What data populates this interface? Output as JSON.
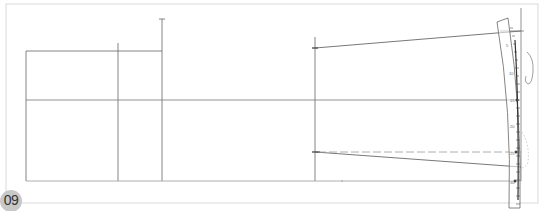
{
  "figure": {
    "step_number": "09",
    "colors": {
      "frame": "#d9d9d9",
      "line": "#555555",
      "guide_line": "#888888",
      "ruler": "#666666",
      "badge_bg": "#c8c8c8",
      "badge_text": "#333333"
    },
    "frame": {
      "x": 6,
      "y": 4,
      "width": 532,
      "height": 199
    },
    "lines": {
      "left_rect": {
        "x1": 26,
        "y1": 51,
        "x2": 162,
        "y2": 181
      },
      "vertical_a": {
        "x": 118,
        "y_top": 43,
        "y_bottom": 181
      },
      "vertical_b": {
        "x": 162,
        "y_top": 19,
        "y_bottom": 181
      },
      "vertical_c": {
        "x": 315,
        "y_top": 37,
        "y_bottom": 181
      },
      "vertical_right": {
        "x": 521,
        "y_top": 8,
        "y_bottom": 181
      },
      "center_horizontal": {
        "x1": 26,
        "x2": 519,
        "y": 100
      },
      "bottom_horizontal": {
        "x1": 26,
        "x2": 521,
        "y": 181
      },
      "upper_slope": {
        "x1": 315,
        "y1": 48,
        "x2": 521,
        "y2": 31
      },
      "lower_slope": {
        "x1": 315,
        "y1": 152,
        "x2": 521,
        "y2": 167
      },
      "lower_dashed": {
        "x1": 315,
        "y1": 152,
        "x2": 521,
        "y2": 152
      }
    },
    "ruler": {
      "name": "curved ruler",
      "labels": [
        "5",
        "10",
        "15",
        "20",
        "25",
        "30"
      ]
    }
  }
}
